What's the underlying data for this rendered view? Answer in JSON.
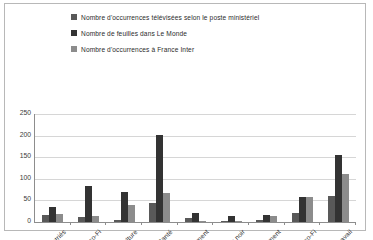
{
  "chart_data": {
    "type": "bar",
    "title": "",
    "xlabel": "",
    "ylabel": "",
    "ylim": [
      0,
      250
    ],
    "yticks": [
      0,
      50,
      100,
      150,
      200,
      250
    ],
    "grid": true,
    "legend_position": "top",
    "categories": [
      "Rapatriés",
      "Budget-Eco-Fi",
      "Agriculture",
      "Santé",
      "Parlement",
      "Trou noir",
      "Parlement",
      "Eco-Fi",
      "Travail"
    ],
    "series": [
      {
        "name": "Nombre d'occurrences télévisées selon le poste ministériel",
        "color": "#595959",
        "values": [
          16,
          12,
          5,
          44,
          9,
          3,
          4,
          22,
          60
        ]
      },
      {
        "name": "Nombre de feuilles dans Le Monde",
        "color": "#333333",
        "values": [
          34,
          84,
          69,
          202,
          20,
          14,
          16,
          58,
          155
        ]
      },
      {
        "name": "Nombre d'occurrences à France Inter",
        "color": "#8c8c8c",
        "values": [
          18,
          14,
          40,
          68,
          3,
          1,
          14,
          58,
          110
        ]
      }
    ]
  },
  "colors": {
    "series_1": "#595959",
    "series_2": "#333333",
    "series_3": "#8c8c8c",
    "gridline": "#d6d6d6",
    "axis": "#8d8d8d",
    "frame": "#b8b8b8",
    "text": "#2f2f2f"
  }
}
